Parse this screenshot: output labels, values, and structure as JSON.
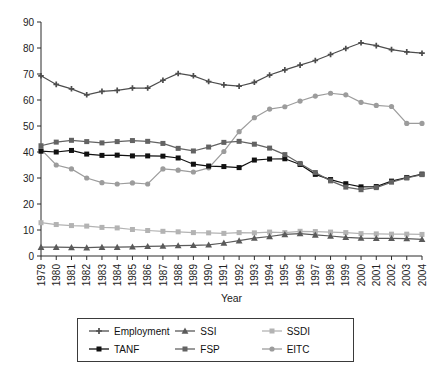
{
  "chart_data": {
    "type": "line",
    "title": "",
    "xlabel": "Year",
    "ylabel": "",
    "ylim": [
      0,
      90
    ],
    "ytick_step": 10,
    "grid": false,
    "legend_position": "bottom",
    "x": [
      1979,
      1980,
      1981,
      1982,
      1983,
      1984,
      1985,
      1986,
      1987,
      1988,
      1989,
      1990,
      1991,
      1992,
      1993,
      1994,
      1995,
      1996,
      1997,
      1998,
      1999,
      2000,
      2001,
      2002,
      2003,
      2004
    ],
    "xticks": [
      "1979",
      "1980",
      "1981",
      "1982",
      "1983",
      "1984",
      "1985",
      "1986",
      "1987",
      "1988",
      "1989",
      "1990",
      "1991",
      "1992",
      "1993",
      "1994",
      "1995",
      "1996",
      "1997",
      "1998",
      "1999",
      "2000",
      "2001",
      "2002",
      "2003",
      "2004"
    ],
    "yticks": [
      "0",
      "10",
      "20",
      "30",
      "40",
      "50",
      "60",
      "70",
      "80",
      "90"
    ],
    "series": [
      {
        "name": "Employment",
        "color": "#4d4d4d",
        "marker": "plus",
        "values": [
          69.3,
          66.0,
          64.3,
          62.0,
          63.3,
          63.7,
          64.6,
          64.6,
          67.6,
          70.2,
          69.3,
          67.1,
          65.8,
          65.3,
          66.8,
          69.6,
          71.6,
          73.4,
          75.2,
          77.5,
          79.8,
          82.0,
          80.9,
          79.4,
          78.5,
          78.0
        ]
      },
      {
        "name": "TANF",
        "color": "#111111",
        "marker": "square",
        "values": [
          40.3,
          40.0,
          40.6,
          39.2,
          38.7,
          38.8,
          38.5,
          38.5,
          38.4,
          37.7,
          35.3,
          34.6,
          34.4,
          34.0,
          36.9,
          37.3,
          37.4,
          35.2,
          31.4,
          29.4,
          27.8,
          26.6,
          26.7,
          28.8,
          30.2,
          31.5
        ]
      },
      {
        "name": "SSI",
        "color": "#5a5a5a",
        "marker": "triangle",
        "values": [
          3.4,
          3.4,
          3.3,
          3.2,
          3.4,
          3.4,
          3.5,
          3.7,
          3.8,
          4.0,
          4.1,
          4.3,
          5.0,
          5.9,
          6.9,
          7.5,
          8.3,
          8.6,
          8.1,
          7.7,
          7.2,
          6.9,
          6.8,
          6.8,
          6.7,
          6.4
        ]
      },
      {
        "name": "FSP",
        "color": "#636363",
        "marker": "square",
        "values": [
          42.4,
          43.8,
          44.5,
          44.0,
          43.5,
          44.0,
          44.4,
          44.1,
          43.3,
          41.4,
          40.4,
          41.9,
          43.7,
          44.1,
          43.0,
          41.5,
          39.0,
          35.6,
          32.1,
          28.9,
          26.5,
          25.5,
          26.3,
          28.4,
          30.0,
          31.3
        ]
      },
      {
        "name": "SSDI",
        "color": "#b3b3b3",
        "marker": "square",
        "values": [
          12.8,
          12.1,
          11.7,
          11.5,
          11.0,
          10.8,
          10.2,
          9.8,
          9.5,
          9.3,
          9.0,
          8.9,
          8.7,
          9.0,
          8.9,
          9.2,
          9.0,
          9.5,
          9.4,
          9.2,
          9.0,
          8.6,
          8.5,
          8.4,
          8.4,
          8.3
        ]
      },
      {
        "name": "EITC",
        "color": "#9c9c9c",
        "marker": "circle",
        "values": [
          41.0,
          35.0,
          33.5,
          30.0,
          28.2,
          27.7,
          28.1,
          27.7,
          33.5,
          33.0,
          32.3,
          33.9,
          40.2,
          47.8,
          53.2,
          56.5,
          57.4,
          59.6,
          61.5,
          62.6,
          62.0,
          59.1,
          57.9,
          57.5,
          51.0,
          51.0
        ]
      }
    ]
  },
  "axes": {
    "x_title": "Year"
  },
  "legend": {
    "items": [
      {
        "label": "Employment"
      },
      {
        "label": "SSI"
      },
      {
        "label": "SSDI"
      },
      {
        "label": "TANF"
      },
      {
        "label": "FSP"
      },
      {
        "label": "EITC"
      }
    ]
  }
}
